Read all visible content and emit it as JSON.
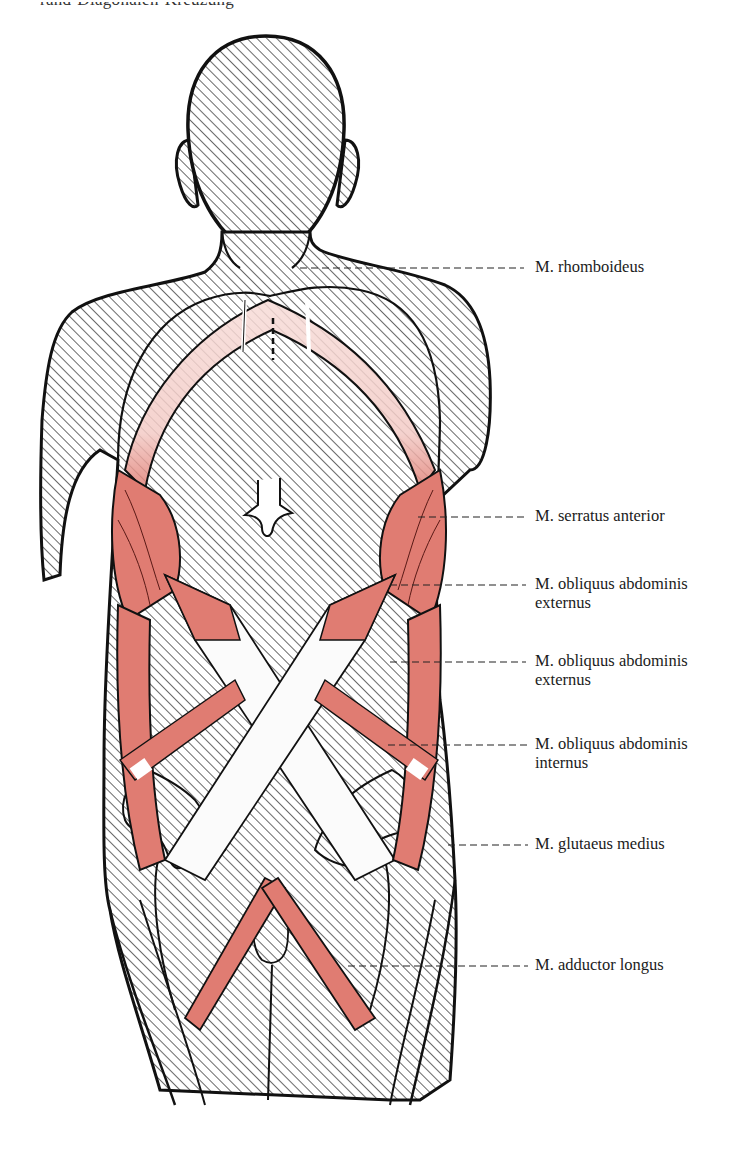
{
  "caption_fragment": "rand-Diagonalen-Kreuzung",
  "figure": {
    "colors": {
      "hatch": "#222222",
      "outline": "#111111",
      "muscle": "#e07c72",
      "muscle_light": "#f5d0cc",
      "tendon": "#ffffff",
      "background": "#ffffff"
    }
  },
  "labels": [
    {
      "id": "rhomboideus",
      "line1": "M. rhomboideus",
      "line2": "",
      "y": 268,
      "leader_from_x": 300,
      "leader_to_x": 524
    },
    {
      "id": "serratus-anterior",
      "line1": "M. serratus anterior",
      "line2": "",
      "y": 517,
      "leader_from_x": 418,
      "leader_to_x": 524
    },
    {
      "id": "obliquus-externus-1",
      "line1": "M. obliquus abdominis",
      "line2": "externus",
      "y": 585,
      "leader_from_x": 390,
      "leader_to_x": 526
    },
    {
      "id": "obliquus-externus-2",
      "line1": "M. obliquus abdominis",
      "line2": "externus",
      "y": 662,
      "leader_from_x": 390,
      "leader_to_x": 526
    },
    {
      "id": "obliquus-internus",
      "line1": "M. obliquus abdominis",
      "line2": "internus",
      "y": 745,
      "leader_from_x": 388,
      "leader_to_x": 528
    },
    {
      "id": "glutaeus-medius",
      "line1": "M. glutaeus medius",
      "line2": "",
      "y": 842,
      "leader_from_x": 448,
      "leader_to_x": 528
    },
    {
      "id": "adductor-longus",
      "line1": "M. adductor longus",
      "line2": "",
      "y": 965,
      "leader_from_x": 348,
      "leader_to_x": 528
    }
  ]
}
